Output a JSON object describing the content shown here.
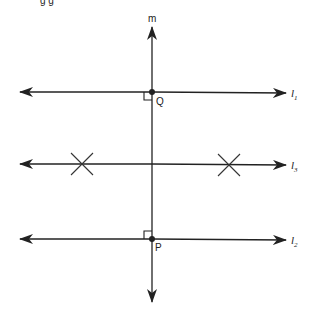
{
  "caption_fragment": "g g",
  "diagram": {
    "lines": {
      "m": {
        "label": "m"
      },
      "l1": {
        "label": "l",
        "subscript": "1"
      },
      "l3": {
        "label": "l",
        "subscript": "3"
      },
      "l2": {
        "label": "l",
        "subscript": "2"
      }
    },
    "points": {
      "Q": {
        "label": "Q"
      },
      "P": {
        "label": "P"
      }
    },
    "colors": {
      "stroke": "#222222",
      "background": "#ffffff"
    }
  }
}
